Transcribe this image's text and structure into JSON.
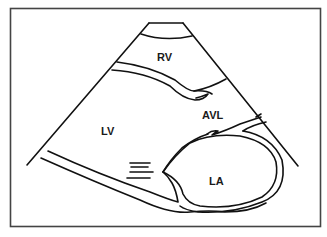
{
  "diagram": {
    "type": "parasternal long-axis echocardiogram schematic",
    "labels": {
      "rv": "RV",
      "lv": "LV",
      "avl": "AVL",
      "la": "LA"
    },
    "colors": {
      "line": "#111111",
      "border": "#444444",
      "background": "#ffffff"
    }
  }
}
